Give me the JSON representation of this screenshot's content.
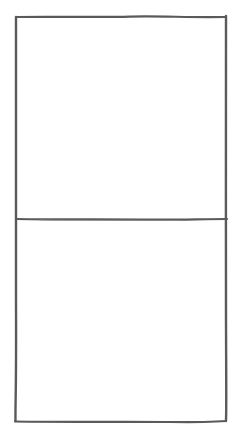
{
  "diagram": {
    "type": "hand-drawn sketch",
    "stroke_color": "#5a5a5a",
    "background": "#ffffff",
    "outer_frame": {
      "x": 15,
      "y": 17,
      "width": 211,
      "height": 405
    },
    "divider_y": 219,
    "panels": [
      {
        "name": "top-panel",
        "label": ""
      },
      {
        "name": "bottom-panel",
        "label": ""
      }
    ]
  }
}
